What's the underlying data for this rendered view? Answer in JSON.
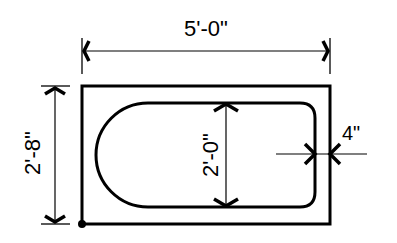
{
  "diagram": {
    "dimensions": {
      "overall_length": "5'-0\"",
      "overall_width": "2'-8\"",
      "inner_basin_width": "2'-0\"",
      "rim_thickness": "4\""
    },
    "colors": {
      "line": "#000000",
      "background": "#ffffff"
    }
  }
}
